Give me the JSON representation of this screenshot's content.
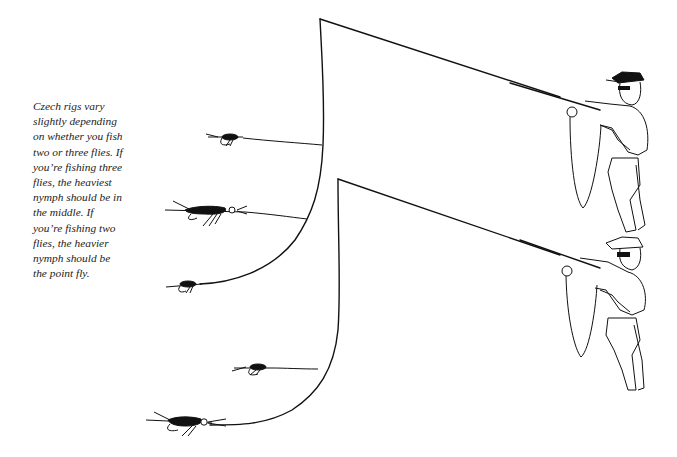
{
  "caption": {
    "lines": [
      "Czech rigs vary",
      "slightly depending",
      "on whether you fish",
      "two or three flies. If",
      "you’re fishing three",
      "flies, the heaviest",
      "nymph should be in",
      "the middle. If",
      "you’re fishing two",
      "flies, the heavier",
      "nymph should be",
      "the point fly."
    ]
  },
  "diagram": {
    "rigs": [
      {
        "name": "three-fly-rig",
        "flies": [
          "top dropper nymph",
          "middle heaviest nymph",
          "point nymph"
        ]
      },
      {
        "name": "two-fly-rig",
        "flies": [
          "dropper nymph",
          "heavier point nymph"
        ]
      }
    ],
    "figures": [
      "angler-top",
      "angler-bottom"
    ],
    "line_color": "#111111",
    "background": "#ffffff"
  }
}
